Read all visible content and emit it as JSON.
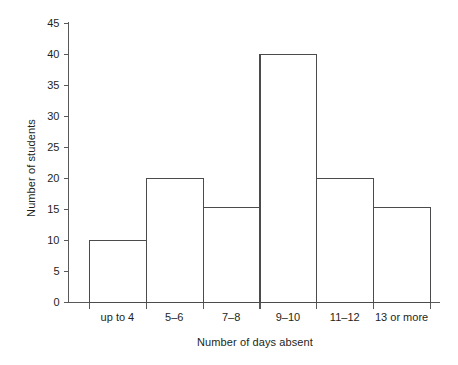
{
  "chart_data": {
    "type": "bar",
    "title": "",
    "subtitle": "",
    "xlabel": "Number of days absent",
    "ylabel": "Number of students",
    "categories": [
      "up to 4",
      "5–6",
      "7–8",
      "9–10",
      "11–12",
      "13 or more"
    ],
    "values": [
      10,
      20,
      15.3,
      40,
      20,
      15.3
    ],
    "ylim": [
      0,
      45
    ],
    "ytick_step": 5,
    "ytick_labels": [
      "0",
      "5",
      "10",
      "15",
      "20",
      "25",
      "30",
      "35",
      "40",
      "45"
    ],
    "grid": false,
    "legend": false,
    "legend_position": "none",
    "bar_style": "outline-only",
    "colors": {
      "bar_stroke": "#4b4b4d",
      "axis": "#58595b",
      "text": "#231f20",
      "background": "#ffffff"
    }
  },
  "axes": {
    "y_title": "Number of students",
    "x_title": "Number of days absent"
  }
}
